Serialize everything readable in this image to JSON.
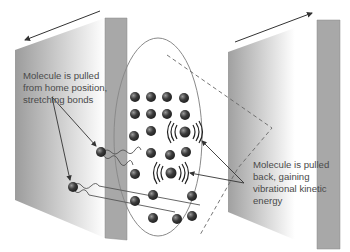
{
  "diagram": {
    "labels": {
      "left_line1": "Molecule is pulled",
      "left_line2": "from home position,",
      "left_line3": "stretching bonds",
      "right_line1": "Molecule is pulled",
      "right_line2": "back, gaining",
      "right_line3": "vibrational kinetic",
      "right_line4": "energy"
    },
    "colors": {
      "panel_dark": "#9a9a9a",
      "panel_light": "#ffffff",
      "side_strip": "#a8a8a8",
      "molecule": "#3a3a3a",
      "lines": "#555555"
    }
  }
}
